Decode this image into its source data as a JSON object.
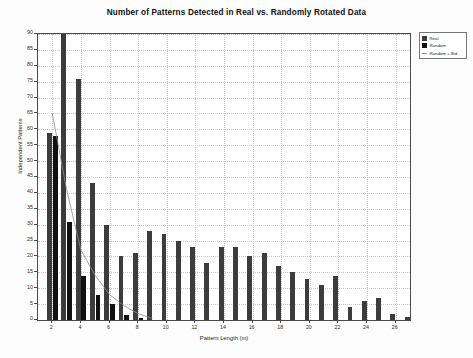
{
  "chart_data": {
    "type": "bar",
    "title": "Number of Patterns Detected in Real vs. Randomly Rotated Data",
    "xlabel": "Pattern Length (m)",
    "ylabel": "Independent Patterns",
    "xlim": [
      1,
      27
    ],
    "ylim": [
      0,
      90
    ],
    "ytick_step": 5,
    "yticks": [
      0,
      5,
      10,
      15,
      20,
      25,
      30,
      35,
      40,
      45,
      50,
      55,
      60,
      65,
      70,
      75,
      80,
      85,
      90
    ],
    "xticks": [
      2,
      4,
      6,
      8,
      10,
      12,
      14,
      16,
      18,
      20,
      22,
      24,
      26
    ],
    "grid": true,
    "legend_position": "outside-top-right",
    "categories": [
      2,
      3,
      4,
      5,
      6,
      7,
      8,
      9,
      10,
      11,
      12,
      13,
      14,
      15,
      16,
      17,
      18,
      19,
      20,
      21,
      22,
      23,
      24,
      25,
      26,
      27
    ],
    "series": [
      {
        "name": "Real",
        "color": "#3c3c3c",
        "values": [
          59,
          92,
          76,
          43,
          30,
          20,
          21,
          28,
          27,
          25,
          23,
          18,
          23,
          23,
          20,
          21,
          17,
          15,
          13,
          11,
          14,
          4,
          6,
          7,
          2,
          1
        ]
      },
      {
        "name": "Random",
        "color": "#111111",
        "values": [
          58,
          31,
          14,
          8,
          5,
          1.5,
          0.6,
          0,
          0,
          0,
          0,
          0,
          0,
          0,
          0,
          0,
          0,
          0,
          0,
          0,
          0,
          0,
          0,
          0,
          0,
          0
        ]
      },
      {
        "name": "Random + Std",
        "color": "#8d8d8d",
        "type": "line",
        "x": [
          2,
          3,
          4,
          5,
          6,
          7,
          8,
          9
        ],
        "values": [
          65,
          41,
          22,
          14,
          8,
          4.5,
          2,
          0.5
        ]
      }
    ]
  },
  "legend": {
    "items": [
      {
        "label": "Real",
        "marker": "swatch",
        "color": "#3c3c3c"
      },
      {
        "label": "Random",
        "marker": "swatch",
        "color": "#111111"
      },
      {
        "label": "Random + Std",
        "marker": "line",
        "color": "#8d8d8d"
      }
    ]
  }
}
